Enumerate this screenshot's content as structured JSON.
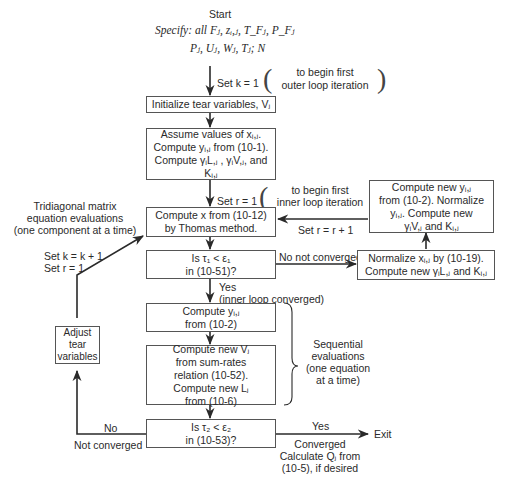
{
  "diagram": {
    "type": "flowchart",
    "start": {
      "label": "Start",
      "specify_line1": "Specify: all Fⱼ, zᵢ,ⱼ, T_Fⱼ, P_Fⱼ",
      "specify_line2": "Pⱼ, Uⱼ, Wⱼ, Tⱼ; N"
    },
    "annotations": {
      "set_k": "Set k = 1",
      "outer_note_1": "to begin first",
      "outer_note_2": "outer loop iteration",
      "set_r": "Set r = 1",
      "inner_note_1": "to begin first",
      "inner_note_2": "inner loop iteration",
      "set_r_plus": "Set r = r + 1",
      "tridiagonal_1": "Tridiagonal matrix",
      "tridiagonal_2": "equation evaluations",
      "tridiagonal_3": "(one component at a time)",
      "set_k_plus": "Set k = k + 1",
      "reset_r": "Set r = 1",
      "no_not_converged": "No not converged",
      "yes_inner": "Yes",
      "inner_converged": "(inner loop converged)",
      "sequential_1": "Sequential",
      "sequential_2": "evaluations",
      "sequential_3": "(one equation",
      "sequential_4": "at a time)",
      "no": "No",
      "not_converged": "Not converged",
      "yes": "Yes",
      "exit": "Exit",
      "converged": "Converged",
      "calc_q_1": "Calculate Qⱼ from",
      "calc_q_2": "(10-5), if desired"
    },
    "boxes": {
      "initialize": "Initialize tear variables, Vⱼ",
      "assume_1": "Assume values of xᵢ,ⱼ.",
      "assume_2": "Compute yᵢ,ⱼ from (10-1).",
      "assume_3": "Compute γᵢL,ⱼ , γᵢV,ⱼ, and Kᵢ,ⱼ",
      "thomas_1": "Compute x from (10-12)",
      "thomas_2": "by Thomas method.",
      "check1_1": "Is τ₁ < ε₁",
      "check1_2": "in (10-51)?",
      "compute_y_1": "Compute yᵢ,ⱼ",
      "compute_y_2": "from (10-2)",
      "compute_v_1": "Compute new Vⱼ",
      "compute_v_2": "from sum-rates",
      "compute_v_3": "relation (10-52).",
      "compute_v_4": "Compute new Lⱼ",
      "compute_v_5": "from (10-6)",
      "check2_1": "Is τ₂ < ε₂",
      "check2_2": "in (10-53)?",
      "normalize_x_1": "Normalize xᵢ,ⱼ by (10-19).",
      "normalize_x_2": "Compute new γᵢL,ⱼ and Kᵢ,ⱼ",
      "compute_new_y_1": "Compute new yᵢ,ⱼ",
      "compute_new_y_2": "from (10-2). Normalize",
      "compute_new_y_3": "yᵢ,ⱼ. Compute new",
      "compute_new_y_4": "γᵢV,ⱼ and Kᵢ,ⱼ",
      "adjust_1": "Adjust",
      "adjust_2": "tear",
      "adjust_3": "variables"
    },
    "colors": {
      "line": "#2a2a2a",
      "box_border": "#555555",
      "text": "#2a2a2a",
      "background": "#ffffff"
    }
  }
}
